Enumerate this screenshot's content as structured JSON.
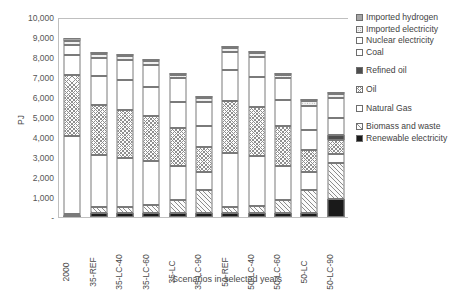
{
  "chart_data": {
    "type": "bar",
    "stacked": true,
    "title": "",
    "xlabel": "Scenarios in selected years",
    "ylabel": "PJ",
    "ylim": [
      0,
      10000
    ],
    "ytick_step": 1000,
    "ytick_labels": [
      "-",
      "1,000",
      "2,000",
      "3,000",
      "4,000",
      "5,000",
      "6,000",
      "7,000",
      "8,000",
      "9,000",
      "10,000"
    ],
    "grid": false,
    "legend_position": "right",
    "categories": [
      "2000",
      "35-REF",
      "35-LC-40",
      "35-LC-60",
      "35-LC",
      "35-LC-90",
      "50-REF",
      "50-LC-40",
      "50-LC-60",
      "50-LC",
      "50-LC-90"
    ],
    "series": [
      {
        "name": "Renewable electricity",
        "pattern": "solid-black",
        "values": [
          60,
          190,
          190,
          190,
          190,
          190,
          190,
          190,
          190,
          190,
          900
        ]
      },
      {
        "name": "Biomass and waste",
        "pattern": "hatch",
        "values": [
          80,
          300,
          330,
          420,
          640,
          1180,
          300,
          380,
          640,
          1180,
          1800
        ]
      },
      {
        "name": "Natural Gas",
        "pattern": "white",
        "values": [
          3900,
          2600,
          2450,
          2200,
          1700,
          880,
          2700,
          2500,
          1700,
          900,
          450
        ]
      },
      {
        "name": "Oil",
        "pattern": "cross",
        "values": [
          3050,
          2500,
          2400,
          2250,
          1900,
          1250,
          2600,
          2450,
          2000,
          1100,
          700
        ]
      },
      {
        "name": "Refined oil",
        "pattern": "solid-dark",
        "values": [
          0,
          0,
          0,
          0,
          0,
          0,
          0,
          0,
          0,
          0,
          250
        ]
      },
      {
        "name": "Coal",
        "pattern": "white",
        "values": [
          1000,
          1450,
          1500,
          1450,
          1300,
          1050,
          1550,
          1500,
          1300,
          1000,
          850
        ]
      },
      {
        "name": "Nuclear electricity",
        "pattern": "white",
        "values": [
          500,
          900,
          1000,
          1100,
          1200,
          1200,
          900,
          1000,
          1100,
          1200,
          1000
        ]
      },
      {
        "name": "Imported electricity",
        "pattern": "dots",
        "values": [
          210,
          200,
          160,
          170,
          170,
          220,
          200,
          200,
          170,
          250,
          180
        ]
      },
      {
        "name": "Imported hydrogen",
        "pattern": "solid-gray",
        "values": [
          150,
          100,
          90,
          90,
          80,
          70,
          100,
          90,
          80,
          70,
          60
        ]
      }
    ]
  },
  "legend": {
    "items": [
      {
        "label": "Imported hydrogen",
        "pattern": "solid-gray"
      },
      {
        "label": "Imported electricity",
        "pattern": "dots"
      },
      {
        "label": "Nuclear electricity",
        "pattern": "white"
      },
      {
        "label": "Coal",
        "pattern": "white"
      },
      {
        "label": "Refined oil",
        "pattern": "solid-dark"
      },
      {
        "label": "Oil",
        "pattern": "cross"
      },
      {
        "label": "Natural Gas",
        "pattern": "white"
      },
      {
        "label": "Biomass and waste",
        "pattern": "hatch"
      },
      {
        "label": "Renewable electricity",
        "pattern": "solid-black"
      }
    ],
    "gap_after_index": [
      3,
      4,
      5,
      6
    ]
  },
  "colors": {
    "axis": "#bfbfbf",
    "text": "#4a4a4a",
    "segment_border": "#7a7a7a",
    "solid_black": "#1a1a1a",
    "solid_dark": "#4d4d4d",
    "solid_gray": "#a6a6a6"
  }
}
